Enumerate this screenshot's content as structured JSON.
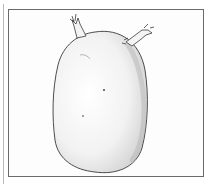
{
  "image": {
    "subject": "pencil sketch of a sprouting potato",
    "alt": "Hand-drawn pencil illustration of an oval potato with two small sprouts at the top, inside a rectangular frame"
  },
  "colors": {
    "background": "#ffffff",
    "frame": "#6a6a6a",
    "outline": "#3a3a3a",
    "shading": "#9a9a9a"
  }
}
